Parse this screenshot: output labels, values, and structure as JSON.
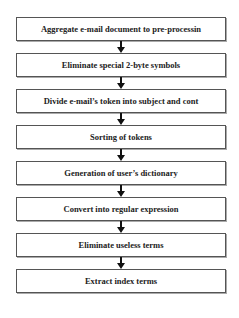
{
  "diagram": {
    "type": "flowchart",
    "direction": "top-to-bottom",
    "steps": [
      {
        "label": "Aggregate e-mail document to pre-processin"
      },
      {
        "label": "Eliminate special 2-byte symbols"
      },
      {
        "label": "Divide e-mail’s token into subject and cont"
      },
      {
        "label": "Sorting of tokens"
      },
      {
        "label": "Generation of user’s dictionary"
      },
      {
        "label": "Convert into regular expression"
      },
      {
        "label": "Eliminate useless terms"
      },
      {
        "label": "Extract index terms"
      }
    ],
    "colors": {
      "border": "#555555",
      "text": "#222222",
      "arrow": "#111111",
      "background": "#ffffff"
    }
  }
}
